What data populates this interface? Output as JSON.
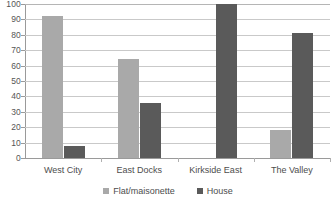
{
  "chart_data": {
    "type": "bar",
    "title": "",
    "subtitle": "",
    "xlabel": "",
    "ylabel": "",
    "categories": [
      "West City",
      "East Docks",
      "Kirkside East",
      "The Valley"
    ],
    "series": [
      {
        "name": "Flat/maisonette",
        "color": "#a9a9a9",
        "values": [
          92,
          64,
          0,
          18
        ]
      },
      {
        "name": "House",
        "color": "#5a5a5a",
        "values": [
          8,
          36,
          100,
          81
        ]
      }
    ],
    "ylim": [
      0,
      100
    ],
    "ytick_step": 10,
    "yticks": [
      0,
      10,
      20,
      30,
      40,
      50,
      60,
      70,
      80,
      90,
      100
    ],
    "ytick_labels": [
      "0",
      "10",
      "20",
      "30",
      "40",
      "50",
      "60",
      "70",
      "80",
      "90",
      "100"
    ],
    "grid": true,
    "grid_axis": "y",
    "legend": true,
    "legend_position": "bottom-center",
    "legend_entries": [
      "Flat/maisonette",
      "House"
    ],
    "bar_orientation": "vertical",
    "background_color": "#ffffff",
    "gridline_color": "#c9c9c9",
    "axis_color": "#9a9a9a",
    "text_color": "#4d4d4d"
  }
}
